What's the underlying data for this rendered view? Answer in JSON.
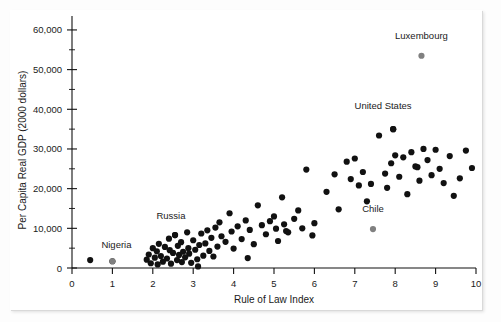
{
  "figure": {
    "background": "#fdfdfd",
    "panel_color": "#ffffff",
    "point_color": "#111111",
    "highlight_point_color": "#808080"
  },
  "chart_data": {
    "type": "scatter",
    "title": "",
    "xlabel": "Rule of Law Index",
    "ylabel": "Per Capita Real GDP (2000 dollars)",
    "xlim": [
      0,
      10
    ],
    "ylim": [
      0,
      62000
    ],
    "grid": false,
    "legend": "none",
    "xticks": [
      0,
      1,
      2,
      3,
      4,
      5,
      6,
      7,
      8,
      9,
      10
    ],
    "xtick_labels": [
      "0",
      "1",
      "2",
      "3",
      "4",
      "5",
      "6",
      "7",
      "8",
      "9",
      "10"
    ],
    "yticks": [
      0,
      10000,
      20000,
      30000,
      40000,
      50000,
      60000
    ],
    "ytick_labels": [
      "0",
      "10,000",
      "20,000",
      "30,000",
      "40,000",
      "50,000",
      "60,000"
    ],
    "y_minor_ticks": [
      5000,
      15000,
      25000,
      35000,
      45000,
      55000
    ],
    "annotations": [
      {
        "label": "Luxembourg",
        "x": 8.65,
        "y": 53500,
        "label_dx": 0,
        "label_dy": 4200,
        "highlight": true
      },
      {
        "label": "United States",
        "x": 7.95,
        "y": 35000,
        "label_dx": -0.25,
        "label_dy": 5000,
        "highlight": false
      },
      {
        "label": "Chile",
        "x": 7.45,
        "y": 9800,
        "label_dx": 0,
        "label_dy": 4200,
        "highlight": true
      },
      {
        "label": "Russia",
        "x": 2.55,
        "y": 8300,
        "label_dx": -0.1,
        "label_dy": 4000,
        "highlight": false
      },
      {
        "label": "Nigeria",
        "x": 1.0,
        "y": 1700,
        "label_dx": 0.1,
        "label_dy": 3400,
        "highlight": true
      }
    ],
    "points": [
      [
        0.45,
        2000
      ],
      [
        1.0,
        1700
      ],
      [
        1.85,
        2100
      ],
      [
        1.9,
        3400
      ],
      [
        1.95,
        1200
      ],
      [
        2.0,
        5000
      ],
      [
        2.05,
        2600
      ],
      [
        2.1,
        4200
      ],
      [
        2.12,
        900
      ],
      [
        2.15,
        6100
      ],
      [
        2.2,
        3000
      ],
      [
        2.25,
        1600
      ],
      [
        2.3,
        5300
      ],
      [
        2.35,
        2400
      ],
      [
        2.4,
        7400
      ],
      [
        2.42,
        4500
      ],
      [
        2.45,
        1100
      ],
      [
        2.5,
        3800
      ],
      [
        2.55,
        8300
      ],
      [
        2.6,
        2000
      ],
      [
        2.62,
        5600
      ],
      [
        2.65,
        3300
      ],
      [
        2.7,
        6500
      ],
      [
        2.72,
        1500
      ],
      [
        2.75,
        4100
      ],
      [
        2.8,
        2700
      ],
      [
        2.85,
        9000
      ],
      [
        2.88,
        5000
      ],
      [
        2.9,
        3600
      ],
      [
        2.95,
        1300
      ],
      [
        3.0,
        7000
      ],
      [
        3.05,
        4600
      ],
      [
        3.1,
        2200
      ],
      [
        3.12,
        400
      ],
      [
        3.15,
        5800
      ],
      [
        3.2,
        8700
      ],
      [
        3.25,
        3100
      ],
      [
        3.3,
        6200
      ],
      [
        3.35,
        9500
      ],
      [
        3.4,
        4300
      ],
      [
        3.45,
        7600
      ],
      [
        3.5,
        2900
      ],
      [
        3.55,
        10200
      ],
      [
        3.6,
        5400
      ],
      [
        3.65,
        11500
      ],
      [
        3.7,
        8000
      ],
      [
        3.8,
        6600
      ],
      [
        3.9,
        13800
      ],
      [
        3.95,
        9200
      ],
      [
        4.0,
        4900
      ],
      [
        4.1,
        10500
      ],
      [
        4.2,
        7300
      ],
      [
        4.3,
        12000
      ],
      [
        4.35,
        2500
      ],
      [
        4.4,
        9600
      ],
      [
        4.5,
        6000
      ],
      [
        4.6,
        15800
      ],
      [
        4.7,
        10800
      ],
      [
        4.8,
        8500
      ],
      [
        4.9,
        11800
      ],
      [
        5.0,
        13000
      ],
      [
        5.05,
        9900
      ],
      [
        5.1,
        6800
      ],
      [
        5.2,
        17800
      ],
      [
        5.25,
        11000
      ],
      [
        5.3,
        9300
      ],
      [
        5.35,
        9000
      ],
      [
        5.5,
        12400
      ],
      [
        5.6,
        14500
      ],
      [
        5.7,
        10000
      ],
      [
        5.8,
        24800
      ],
      [
        5.95,
        8200
      ],
      [
        6.0,
        11300
      ],
      [
        6.3,
        19200
      ],
      [
        6.5,
        23600
      ],
      [
        6.6,
        14800
      ],
      [
        6.8,
        26800
      ],
      [
        6.9,
        22400
      ],
      [
        7.0,
        27600
      ],
      [
        7.1,
        20800
      ],
      [
        7.2,
        24200
      ],
      [
        7.3,
        16800
      ],
      [
        7.4,
        21200
      ],
      [
        7.6,
        33400
      ],
      [
        7.75,
        23800
      ],
      [
        7.8,
        20200
      ],
      [
        7.9,
        26400
      ],
      [
        7.95,
        35000
      ],
      [
        8.0,
        28400
      ],
      [
        8.1,
        23000
      ],
      [
        8.2,
        27900
      ],
      [
        8.3,
        18600
      ],
      [
        8.4,
        29200
      ],
      [
        8.5,
        25600
      ],
      [
        8.55,
        25400
      ],
      [
        8.6,
        22000
      ],
      [
        8.7,
        30000
      ],
      [
        8.8,
        27200
      ],
      [
        8.9,
        23400
      ],
      [
        9.0,
        29800
      ],
      [
        9.1,
        25000
      ],
      [
        9.2,
        21400
      ],
      [
        9.35,
        28200
      ],
      [
        9.45,
        18200
      ],
      [
        9.6,
        22600
      ],
      [
        9.75,
        29600
      ],
      [
        9.9,
        25200
      ]
    ]
  }
}
